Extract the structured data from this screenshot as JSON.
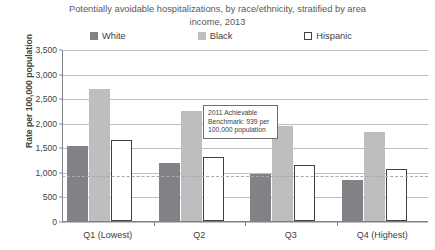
{
  "chart_data": {
    "type": "bar",
    "title": "Potentially avoidable hospitalizations, by race/ethnicity, stratified by area income, 2013",
    "xlabel": "",
    "ylabel": "Rate per 100,000 population",
    "ylim": [
      0,
      3500
    ],
    "ytick_step": 500,
    "ytick_labels": [
      "3,500",
      "3,000",
      "2,500",
      "2,000",
      "1,500",
      "1,000",
      "500",
      "0"
    ],
    "ytick_values": [
      3500,
      3000,
      2500,
      2000,
      1500,
      1000,
      500,
      0
    ],
    "grid": true,
    "legend_position": "top",
    "categories": [
      "Q1 (Lowest)",
      "Q2",
      "Q3",
      "Q4 (Highest)"
    ],
    "series": [
      {
        "name": "White",
        "color": "#808285",
        "values": [
          1520,
          1180,
          950,
          830
        ]
      },
      {
        "name": "Black",
        "color": "#bcbec0",
        "values": [
          2690,
          2230,
          1930,
          1810
        ]
      },
      {
        "name": "Hispanic",
        "color": "#ffffff",
        "values": [
          1650,
          1300,
          1140,
          1050
        ]
      }
    ],
    "reference_line": {
      "value": 939,
      "style": "dashed",
      "color": "#a7a9ac",
      "annotation": "2011 Achievable Benchmark: 939 per 100,000 population"
    }
  }
}
